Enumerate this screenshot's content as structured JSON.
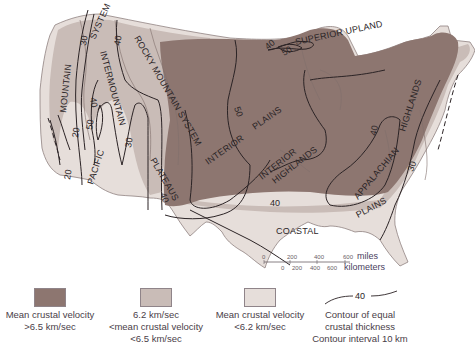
{
  "map": {
    "regions": [
      {
        "label": "MOUNTAIN"
      },
      {
        "label": "SYSTEM"
      },
      {
        "label": "PACIFIC"
      },
      {
        "label": "INTERMOUNTAIN"
      },
      {
        "label": "ROCKY MOUNTAIN SYSTEM"
      },
      {
        "label": "PLATEAUS"
      },
      {
        "label": "INTERIOR"
      },
      {
        "label": "PLAINS"
      },
      {
        "label": "SUPERIOR UPLAND"
      },
      {
        "label": "INTERIOR"
      },
      {
        "label": "HIGHLANDS"
      },
      {
        "label": "APPALACHIAN"
      },
      {
        "label": "HIGHLANDS"
      },
      {
        "label": "PLAINS"
      },
      {
        "label": "COASTAL"
      }
    ],
    "contour_labels": [
      "20",
      "20",
      "30",
      "30",
      "40",
      "40",
      "50",
      "30",
      "40",
      "50",
      "40",
      "50",
      "40",
      "40",
      "30",
      "40"
    ],
    "colors": {
      "high_velocity": "#8d7670",
      "mid_velocity": "#c9bcb7",
      "low_velocity": "#e6deda",
      "contour": "#2b2325",
      "boundary": "#7f6f6c"
    }
  },
  "scale_bar": {
    "miles_ticks": [
      "0",
      "200",
      "400",
      "600"
    ],
    "miles_unit": "miles",
    "km_ticks": [
      "0",
      "200",
      "400",
      "600"
    ],
    "km_unit": "kilometers"
  },
  "legend": {
    "items": [
      {
        "line1": "Mean crustal velocity",
        "line2": ">6.5 km/sec",
        "line3": "",
        "color": "#8d7670"
      },
      {
        "line1": "6.2 km/sec",
        "line2": "<mean crustal velocity",
        "line3": "<6.5 km/sec",
        "color": "#c9bcb7"
      },
      {
        "line1": "Mean crustal velocity",
        "line2": "<6.2 km/sec",
        "line3": "",
        "color": "#e6deda"
      }
    ],
    "contour": {
      "sample_value": "40",
      "line1": "Contour of equal",
      "line2": "crustal thickness",
      "line3": "Contour interval 10 km"
    }
  }
}
